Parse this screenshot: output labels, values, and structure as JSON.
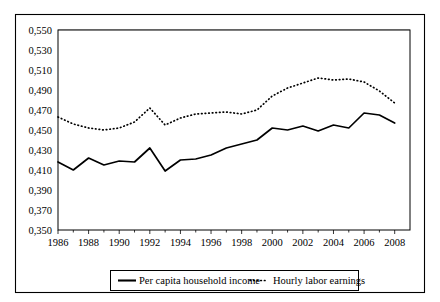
{
  "chart_data": {
    "type": "line",
    "title": "",
    "subtitle": "",
    "xlabel": "",
    "ylabel": "",
    "x": [
      1986,
      1987,
      1988,
      1989,
      1990,
      1991,
      1992,
      1993,
      1994,
      1995,
      1996,
      1997,
      1998,
      1999,
      2000,
      2001,
      2002,
      2003,
      2004,
      2005,
      2006,
      2007,
      2008
    ],
    "xlim": [
      1986,
      2009
    ],
    "ylim": [
      0.35,
      0.55
    ],
    "ytick_step": 0.02,
    "ytick_labels": [
      "0,350",
      "0,370",
      "0,390",
      "0,410",
      "0,430",
      "0,450",
      "0,470",
      "0,490",
      "0,510",
      "0,530",
      "0,550"
    ],
    "ytick_values": [
      0.35,
      0.37,
      0.39,
      0.41,
      0.43,
      0.45,
      0.47,
      0.49,
      0.51,
      0.53,
      0.55
    ],
    "xtick_labels": [
      "1986",
      "1988",
      "1990",
      "1992",
      "1994",
      "1996",
      "1998",
      "2000",
      "2002",
      "2004",
      "2006",
      "2008"
    ],
    "xtick_values": [
      1986,
      1988,
      1990,
      1992,
      1994,
      1996,
      1998,
      2000,
      2002,
      2004,
      2006,
      2008
    ],
    "xminor_values": [
      1987,
      1989,
      1991,
      1993,
      1995,
      1997,
      1999,
      2001,
      2003,
      2005,
      2007
    ],
    "grid": true,
    "grid_axis": "y",
    "legend_position": "bottom",
    "decimal_separator": ",",
    "series": [
      {
        "name": "Per capita household income",
        "style": "solid",
        "color": "#000000",
        "values": [
          0.418,
          0.41,
          0.422,
          0.415,
          0.419,
          0.418,
          0.432,
          0.409,
          0.42,
          0.421,
          0.425,
          0.432,
          0.436,
          0.44,
          0.452,
          0.45,
          0.454,
          0.449,
          0.455,
          0.452,
          0.467,
          0.465,
          0.457
        ]
      },
      {
        "name": "Hourly labor earnings",
        "style": "dotted",
        "color": "#000000",
        "values": [
          0.463,
          0.456,
          0.452,
          0.45,
          0.452,
          0.458,
          0.472,
          0.455,
          0.462,
          0.466,
          0.467,
          0.468,
          0.466,
          0.47,
          0.484,
          0.492,
          0.497,
          0.502,
          0.5,
          0.501,
          0.498,
          0.489,
          0.477
        ]
      }
    ]
  },
  "legend": {
    "entries": [
      {
        "label": "Per capita household income",
        "style": "solid"
      },
      {
        "label": "Hourly labor earnings",
        "style": "dotted"
      }
    ]
  }
}
